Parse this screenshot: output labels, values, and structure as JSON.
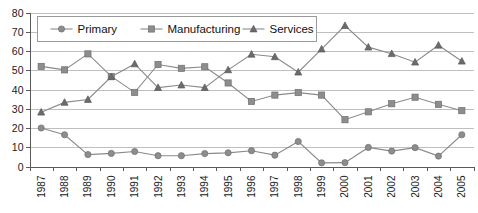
{
  "chart_data": {
    "type": "line",
    "title": "",
    "xlabel": "",
    "ylabel": "",
    "ylim": [
      0,
      80
    ],
    "ytick_step": 10,
    "grid": true,
    "legend_position": "top-left-inside",
    "categories": [
      "1987",
      "1988",
      "1989",
      "1990",
      "1991",
      "1992",
      "1993",
      "1994",
      "1995",
      "1996",
      "1997",
      "1998",
      "1999",
      "2000",
      "2001",
      "2002",
      "2003",
      "2004",
      "2005"
    ],
    "ytick_labels": [
      "0",
      "10",
      "20",
      "30",
      "40",
      "50",
      "60",
      "70",
      "80"
    ],
    "series": [
      {
        "name": "Primary",
        "marker": "circle",
        "color": "#8d8d8d",
        "values": [
          20.0,
          16.5,
          6.2,
          6.8,
          7.8,
          5.6,
          5.6,
          6.7,
          7.1,
          8.2,
          5.9,
          13.0,
          1.9,
          2.0,
          9.9,
          8.0,
          9.8,
          5.4,
          16.5
        ]
      },
      {
        "name": "Manufacturing",
        "marker": "square",
        "color": "#8d8d8d",
        "values": [
          52.0,
          50.2,
          58.5,
          46.8,
          38.5,
          53.0,
          51.0,
          51.8,
          43.4,
          33.8,
          37.1,
          38.4,
          37.1,
          24.3,
          28.4,
          32.6,
          36.0,
          32.3,
          29.0
        ]
      },
      {
        "name": "Services",
        "marker": "triangle",
        "color": "#6b6b6b",
        "values": [
          28.2,
          33.3,
          34.8,
          46.6,
          53.3,
          41.0,
          42.3,
          41.0,
          50.2,
          58.3,
          57.0,
          49.0,
          61.0,
          73.2,
          62.0,
          58.6,
          54.2,
          63.0,
          54.7
        ]
      }
    ]
  },
  "legend": {
    "items": [
      {
        "label": "Primary"
      },
      {
        "label": "Manufacturing"
      },
      {
        "label": "Services"
      }
    ]
  }
}
